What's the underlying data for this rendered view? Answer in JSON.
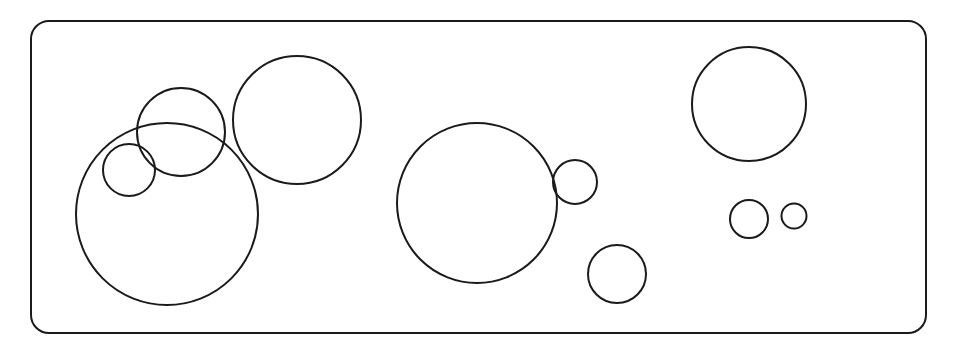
{
  "diagram": {
    "stroke_color": "#1a1a1a",
    "background": "#ffffff",
    "frame": {
      "x": 31,
      "y": 21,
      "width": 895,
      "height": 312,
      "radius": 18,
      "stroke_width": 2
    },
    "circles": [
      {
        "id": "large-left",
        "cx": 167,
        "cy": 214,
        "r": 91
      },
      {
        "id": "medium-top-left",
        "cx": 181,
        "cy": 132,
        "r": 44
      },
      {
        "id": "small-left",
        "cx": 129,
        "cy": 170,
        "r": 26
      },
      {
        "id": "medium-upper",
        "cx": 297,
        "cy": 120,
        "r": 64
      },
      {
        "id": "large-center",
        "cx": 477,
        "cy": 203,
        "r": 80
      },
      {
        "id": "small-center-right",
        "cx": 575,
        "cy": 182,
        "r": 22
      },
      {
        "id": "small-bottom-center",
        "cx": 617,
        "cy": 274,
        "r": 29
      },
      {
        "id": "medium-top-right",
        "cx": 749,
        "cy": 104,
        "r": 57
      },
      {
        "id": "small-right",
        "cx": 749,
        "cy": 219,
        "r": 19
      },
      {
        "id": "tiny-right",
        "cx": 794,
        "cy": 216,
        "r": 12.5
      }
    ]
  }
}
